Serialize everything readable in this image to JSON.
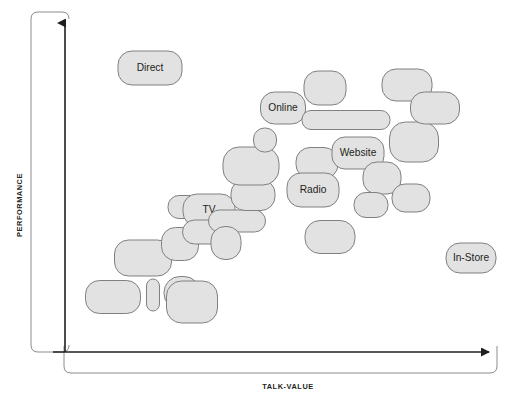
{
  "chart_data": {
    "type": "scatter",
    "title": "",
    "subtitle": "",
    "xlabel": "TALK-VALUE",
    "ylabel": "PERFORMANCE",
    "xlim": [
      0,
      100
    ],
    "ylim": [
      0,
      100
    ],
    "grid": false,
    "legend": "none",
    "annotations": [],
    "marker_shape": "rounded-rectangle",
    "marker_fill": "#e2e2e2",
    "marker_stroke": "#808080",
    "axis_color": "#231f20",
    "label_color": "#231f20",
    "note": "Bubble/blob scatter: each marker is a rounded rectangle of varying size positioned in pixel space; six markers carry visible text labels, the rest are unlabeled.",
    "points": [
      {
        "id": "p01",
        "label": "Direct",
        "x": 150,
        "y": 68,
        "w": 64,
        "h": 34,
        "r": 14
      },
      {
        "id": "p02",
        "label": "",
        "x": 143,
        "y": 258,
        "w": 57,
        "h": 36,
        "r": 14
      },
      {
        "id": "p03",
        "label": "",
        "x": 113,
        "y": 297,
        "w": 55,
        "h": 33,
        "r": 14
      },
      {
        "id": "p04",
        "label": "",
        "x": 153,
        "y": 295,
        "w": 13,
        "h": 32,
        "r": 7
      },
      {
        "id": "p05",
        "label": "",
        "x": 182,
        "y": 293,
        "w": 36,
        "h": 33,
        "r": 16
      },
      {
        "id": "p06",
        "label": "",
        "x": 192,
        "y": 302,
        "w": 51,
        "h": 42,
        "r": 15
      },
      {
        "id": "p07",
        "label": "",
        "x": 180,
        "y": 244,
        "w": 37,
        "h": 33,
        "r": 14
      },
      {
        "id": "p08",
        "label": "",
        "x": 185,
        "y": 207,
        "w": 34,
        "h": 23,
        "r": 11
      },
      {
        "id": "p09",
        "label": "TV",
        "x": 209,
        "y": 210,
        "w": 52,
        "h": 32,
        "r": 14
      },
      {
        "id": "p10",
        "label": "",
        "x": 208,
        "y": 232,
        "w": 51,
        "h": 24,
        "r": 12
      },
      {
        "id": "p11",
        "label": "",
        "x": 237,
        "y": 221,
        "w": 57,
        "h": 22,
        "r": 11
      },
      {
        "id": "p12",
        "label": "",
        "x": 226,
        "y": 243,
        "w": 30,
        "h": 33,
        "r": 14
      },
      {
        "id": "p13",
        "label": "",
        "x": 253,
        "y": 195,
        "w": 44,
        "h": 31,
        "r": 14
      },
      {
        "id": "p14",
        "label": "",
        "x": 251,
        "y": 166,
        "w": 56,
        "h": 38,
        "r": 16
      },
      {
        "id": "p15",
        "label": "",
        "x": 265,
        "y": 140,
        "w": 23,
        "h": 24,
        "r": 11
      },
      {
        "id": "p16",
        "label": "Online",
        "x": 283,
        "y": 108,
        "w": 45,
        "h": 32,
        "r": 14
      },
      {
        "id": "p17",
        "label": "",
        "x": 325,
        "y": 88,
        "w": 42,
        "h": 34,
        "r": 14
      },
      {
        "id": "p18",
        "label": "",
        "x": 346,
        "y": 120,
        "w": 88,
        "h": 19,
        "r": 9
      },
      {
        "id": "p19",
        "label": "",
        "x": 317,
        "y": 163,
        "w": 42,
        "h": 31,
        "r": 14
      },
      {
        "id": "p20",
        "label": "Radio",
        "x": 313,
        "y": 190,
        "w": 52,
        "h": 34,
        "r": 14
      },
      {
        "id": "p21",
        "label": "",
        "x": 330,
        "y": 237,
        "w": 50,
        "h": 33,
        "r": 15
      },
      {
        "id": "p22",
        "label": "Website",
        "x": 358,
        "y": 153,
        "w": 52,
        "h": 32,
        "r": 13
      },
      {
        "id": "p23",
        "label": "",
        "x": 382,
        "y": 178,
        "w": 38,
        "h": 32,
        "r": 14
      },
      {
        "id": "p24",
        "label": "",
        "x": 371,
        "y": 205,
        "w": 34,
        "h": 25,
        "r": 12
      },
      {
        "id": "p25",
        "label": "",
        "x": 414,
        "y": 142,
        "w": 49,
        "h": 40,
        "r": 16
      },
      {
        "id": "p26",
        "label": "",
        "x": 411,
        "y": 198,
        "w": 38,
        "h": 28,
        "r": 13
      },
      {
        "id": "p27",
        "label": "",
        "x": 407,
        "y": 85,
        "w": 50,
        "h": 32,
        "r": 14
      },
      {
        "id": "p28",
        "label": "",
        "x": 435,
        "y": 108,
        "w": 49,
        "h": 32,
        "r": 14
      },
      {
        "id": "p29",
        "label": "In-Store",
        "x": 471,
        "y": 258,
        "w": 50,
        "h": 30,
        "r": 14
      }
    ]
  },
  "axes": {
    "y_axis": {
      "label": "PERFORMANCE",
      "arrow": "up",
      "arrow_name": "y-axis-arrowhead"
    },
    "x_axis": {
      "label": "TALK-VALUE",
      "arrow": "right",
      "arrow_name": "x-axis-arrowhead"
    }
  },
  "colors": {
    "bubble_fill": "#e2e2e2",
    "bubble_stroke": "#808080",
    "axis": "#231f20",
    "frame_stroke": "#8c8c8c",
    "text": "#231f20",
    "background": "#ffffff"
  }
}
